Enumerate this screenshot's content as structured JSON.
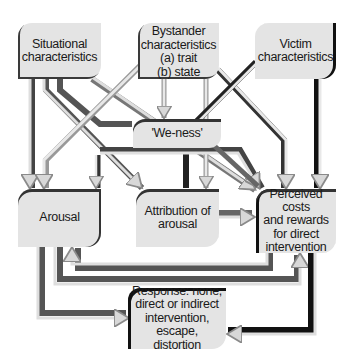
{
  "diagram": {
    "type": "flow-model",
    "colors": {
      "box_fill": "#e4e4e4",
      "arrow_light": "#dcdcdc",
      "arrow_outline": "#9a9a9a",
      "arrow_dark": "#555555",
      "shadow": "#222222"
    },
    "nodes": {
      "situational": {
        "label": "Situational\ncharacteristics"
      },
      "bystander": {
        "label": "Bystander\ncharacteristics\n(a) trait\n(b) state"
      },
      "victim": {
        "label": "Victim\ncharacteristics"
      },
      "weness": {
        "label": "'We-ness'"
      },
      "arousal": {
        "label": "Arousal"
      },
      "attribution": {
        "label": "Attribution of\narousal"
      },
      "perceived": {
        "label": "Perceived\ncosts\nand rewards\nfor direct\nintervention"
      },
      "response": {
        "label": "Response: none,\ndirect or indirect\nintervention,\nescape, distortion"
      }
    },
    "edges": [
      {
        "from": "Situational characteristics",
        "to": "Arousal"
      },
      {
        "from": "Situational characteristics",
        "to": "Attribution of arousal"
      },
      {
        "from": "Situational characteristics",
        "to": "'We-ness'"
      },
      {
        "from": "Situational characteristics",
        "to": "Perceived costs and rewards for direct intervention"
      },
      {
        "from": "Bystander characteristics",
        "to": "Arousal"
      },
      {
        "from": "Bystander characteristics",
        "to": "'We-ness'"
      },
      {
        "from": "Bystander characteristics",
        "to": "Attribution of arousal"
      },
      {
        "from": "Bystander characteristics",
        "to": "Perceived costs and rewards for direct intervention"
      },
      {
        "from": "Victim characteristics",
        "to": "Attribution of arousal"
      },
      {
        "from": "Victim characteristics",
        "to": "Perceived costs and rewards for direct intervention"
      },
      {
        "from": "'We-ness'",
        "to": "Arousal"
      },
      {
        "from": "'We-ness'",
        "to": "Perceived costs and rewards for direct intervention"
      },
      {
        "from": "Attribution of arousal",
        "to": "Perceived costs and rewards for direct intervention"
      },
      {
        "from": "Arousal",
        "to": "Perceived costs and rewards for direct intervention"
      },
      {
        "from": "Perceived costs and rewards for direct intervention",
        "to": "Arousal"
      },
      {
        "from": "Arousal",
        "to": "Response: none, direct or indirect intervention, escape, distortion"
      },
      {
        "from": "Perceived costs and rewards for direct intervention",
        "to": "Response: none, direct or indirect intervention, escape, distortion"
      }
    ]
  }
}
